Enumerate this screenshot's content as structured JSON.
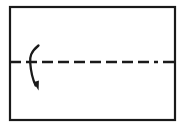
{
  "figure": {
    "description": "Rectangular sheet with a horizontal dashed fold line and a curved arrow indicating folding the top half down",
    "background_color": "#ffffff",
    "ink_color": "#1a1a1a"
  },
  "sheet": {
    "name": "paper sheet",
    "x": 10,
    "y": 7,
    "width": 165,
    "height": 113,
    "stroke_color": "#1a1a1a",
    "stroke_width": 2.2,
    "fill_color": "#ffffff"
  },
  "fold_line": {
    "name": "horizontal fold crease",
    "style": "dash-dot",
    "y": 62,
    "x_start": 10,
    "x_end": 175,
    "stroke_color": "#1a1a1a",
    "stroke_width": 2.4,
    "dash_pattern": "11 5 11 5 11 5 11 5 11 5 11 5 11 5 11 5 11 5 4 5"
  },
  "fold_arrow": {
    "name": "fold direction arrow",
    "direction": "downward",
    "arc_path": "M 38.5 45.5 C 30.5 52 29.8 57 30.2 62.5 C 30.7 70 32.6 79 35.6 85.5",
    "stroke_color": "#1a1a1a",
    "stroke_width": 2.3,
    "head_points": "33.4,82.2 38.6,90.6 38.9,80.4",
    "head_color": "#1a1a1a"
  }
}
